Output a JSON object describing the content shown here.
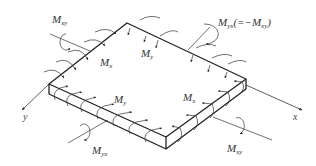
{
  "diagram": {
    "colors": {
      "line": "#222222",
      "text": "#333333",
      "background": "#ffffff"
    },
    "labels": {
      "mxy_top": {
        "main": "M",
        "sub": "xy"
      },
      "myx_top": {
        "main": "M",
        "sub": "yx",
        "suffix": "(=−M",
        "suffix_sub": "xy",
        "suffix_end": ")"
      },
      "mx_top": {
        "main": "M",
        "sub": "x"
      },
      "my_top": {
        "main": "M",
        "sub": "y"
      },
      "my_front": {
        "main": "M",
        "sub": "y"
      },
      "mx_front": {
        "main": "M",
        "sub": "x"
      },
      "myx_bottom": {
        "main": "M",
        "sub": "yx"
      },
      "mxy_bottom": {
        "main": "M",
        "sub": "xy"
      }
    },
    "axes": {
      "x": "x",
      "y": "y"
    }
  }
}
